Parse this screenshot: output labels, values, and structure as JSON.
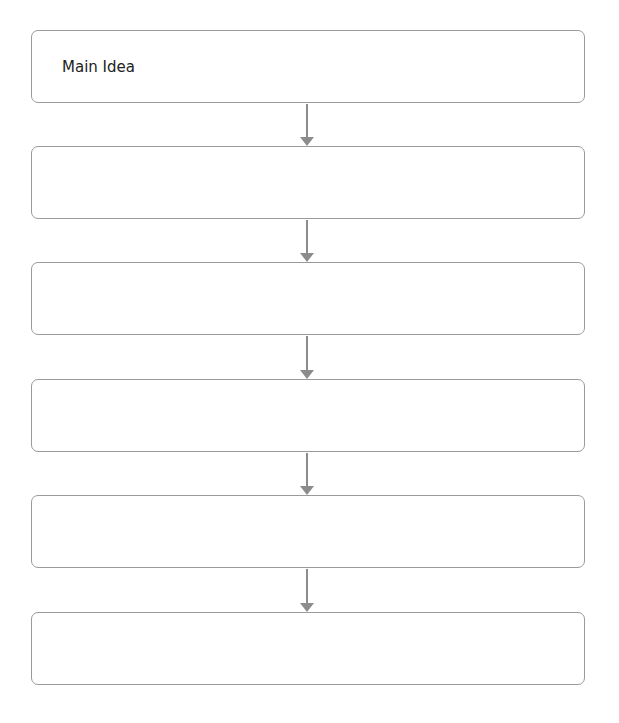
{
  "diagram": {
    "type": "vertical-flowchart",
    "stroke_color": "#9a9a9a",
    "arrow_color": "#8c8c8c",
    "boxes": [
      {
        "label": "Main Idea"
      },
      {
        "label": ""
      },
      {
        "label": ""
      },
      {
        "label": ""
      },
      {
        "label": ""
      },
      {
        "label": ""
      }
    ],
    "arrows": 5
  }
}
